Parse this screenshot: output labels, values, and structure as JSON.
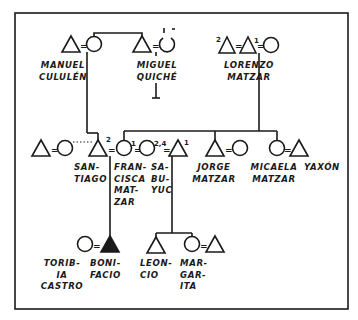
{
  "diagram": {
    "type": "kinship-chart",
    "colors": {
      "ink": "#1a1a1a",
      "background": "#ffffff"
    },
    "symbols": {
      "male": "triangle",
      "female": "circle",
      "ego": "filled-triangle",
      "marriage": "=",
      "informal_union": "dotted-line"
    },
    "generation_1": {
      "manuel": {
        "label": "MANUEL\nCULULÉN"
      },
      "miguel": {
        "label": "MIGUEL\nQUICHÉ",
        "wife_marks": [
          "1",
          "-"
        ]
      },
      "lorenzo": {
        "label": "LORENZO\nMATZAR",
        "marks": [
          "2",
          "1"
        ]
      }
    },
    "generation_2": {
      "santiago": {
        "label": "SAN-\nTIAGO",
        "mark": "2"
      },
      "francisca": {
        "label": "FRAN-\nCISCA\nMAT-\nZAR",
        "mark": "1"
      },
      "sabuyuc": {
        "label": "SA-\nBU-\nYUC",
        "mark": "2,4"
      },
      "husband_mark": "1",
      "jorge": {
        "label": "JORGE\nMATZAR"
      },
      "micaela": {
        "label": "MICAELA\nMATZAR"
      },
      "yaxon": {
        "label": "YAXÓN"
      }
    },
    "generation_3": {
      "toribia": {
        "label": "TORIB-\nIA\nCASTRO"
      },
      "bonifacio": {
        "label": "BONI-\nFACIO"
      },
      "leoncio": {
        "label": "LEON-\nCIO"
      },
      "margarita": {
        "label": "MAR-\nGAR-\nITA"
      }
    },
    "marriage_sign": "="
  }
}
